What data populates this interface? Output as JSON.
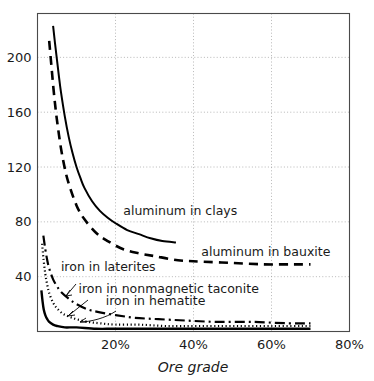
{
  "chart_data": {
    "type": "line",
    "title": "",
    "xlabel": "Ore grade",
    "ylabel": "",
    "xlim": [
      0,
      80
    ],
    "ylim": [
      0,
      232
    ],
    "grid": true,
    "legend_position": "inline-annotations",
    "xticks": [
      "20%",
      "40%",
      "60%",
      "80%"
    ],
    "xtick_values": [
      20,
      40,
      60,
      80
    ],
    "yticks": [
      "40",
      "80",
      "120",
      "160",
      "200"
    ],
    "ytick_values": [
      40,
      80,
      120,
      160,
      200
    ],
    "series": [
      {
        "name": "aluminum in clays",
        "style": "solid",
        "x": [
          4.0,
          4.5,
          5.0,
          5.5,
          6.0,
          7.0,
          8.0,
          9.0,
          10.0,
          11.0,
          12.0,
          14.0,
          16.0,
          18.0,
          20.0,
          23.0,
          26.0,
          29.0,
          32.0,
          35.5
        ],
        "values": [
          223,
          210,
          198,
          186,
          175,
          157,
          142,
          130,
          120,
          112,
          105,
          95,
          88,
          83,
          79,
          74,
          71,
          68,
          66,
          65
        ]
      },
      {
        "name": "aluminum in bauxite",
        "style": "dashed",
        "x": [
          3.0,
          3.5,
          4.0,
          4.5,
          5.0,
          6.0,
          7.0,
          8.0,
          10.0,
          12.0,
          15.0,
          18.0,
          22.0,
          26.0,
          30.0,
          36.0,
          42.0,
          50.0,
          58.0,
          65.0,
          70.0
        ],
        "values": [
          212,
          196,
          180,
          166,
          154,
          134,
          119,
          108,
          92,
          82,
          72,
          66,
          60,
          57,
          55,
          52,
          51,
          50,
          49,
          49,
          49
        ]
      },
      {
        "name": "iron in laterites",
        "style": "dash-dot",
        "x": [
          1.5,
          2.0,
          2.5,
          3.0,
          4.0,
          5.0,
          6.0,
          8.0,
          10.0,
          13.0,
          16.0,
          20.0,
          25.0,
          31.0,
          38.0,
          46.0,
          55.0,
          64.0,
          70.0
        ],
        "values": [
          70,
          60,
          52,
          46,
          38,
          33,
          29,
          24,
          20,
          16,
          14,
          12,
          10,
          9,
          8,
          7,
          7,
          6,
          6
        ]
      },
      {
        "name": "iron in nonmagnetic taconite",
        "style": "dotted",
        "x": [
          1.2,
          1.5,
          2.0,
          2.5,
          3.0,
          4.0,
          5.0,
          6.5,
          8.0,
          10.0,
          13.0,
          16.0,
          20.0,
          26.0,
          33.0,
          41.0,
          50.0,
          60.0,
          70.0
        ],
        "values": [
          64,
          54,
          42,
          34,
          28,
          21,
          17,
          13,
          11,
          9,
          7,
          6,
          5,
          5,
          4,
          4,
          4,
          4,
          4
        ]
      },
      {
        "name": "iron in hematite",
        "style": "solid-thick",
        "x": [
          1.0,
          1.3,
          1.6,
          2.0,
          2.5,
          3.0,
          4.0,
          5.0,
          7.0,
          10.0,
          15.0,
          20.0,
          30.0,
          40.0,
          55.0,
          70.0
        ],
        "values": [
          30,
          22,
          16,
          12,
          9,
          7,
          5,
          4,
          3,
          3,
          2,
          2,
          2,
          2,
          2,
          2
        ]
      }
    ],
    "annotations": [
      {
        "text": "aluminum in clays",
        "x": 22.0,
        "y": 88
      },
      {
        "text": "aluminum in bauxite",
        "x": 42.0,
        "y": 58
      },
      {
        "text": "iron in laterites",
        "x": 6.0,
        "y": 47
      },
      {
        "text": "iron in nonmagnetic taconite",
        "x": 10.5,
        "y": 31
      },
      {
        "text": "iron in hematite",
        "x": 17.5,
        "y": 22
      }
    ]
  }
}
